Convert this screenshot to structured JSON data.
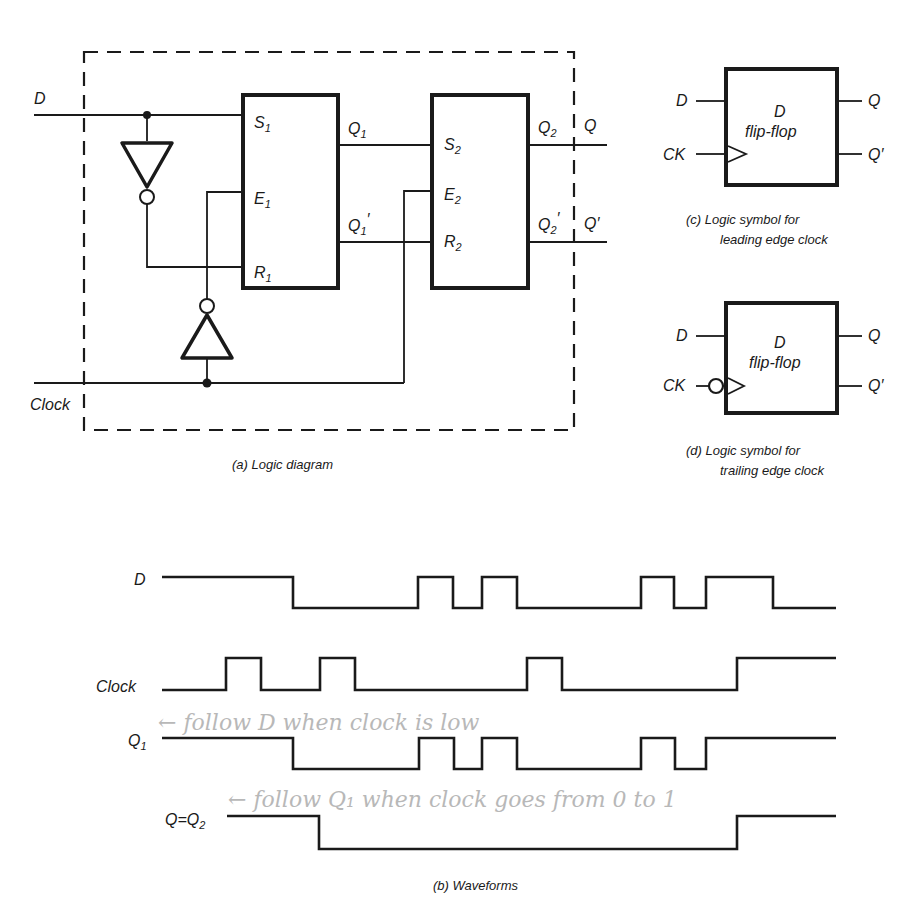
{
  "top_text_fragment": "...the output of the master, the edge at which the change is triggered by...",
  "logic_diagram": {
    "caption": "(a) Logic diagram",
    "inputs": {
      "d": "D",
      "clock": "Clock"
    },
    "master_latch": {
      "s": "S",
      "s_sub": "1",
      "e": "E",
      "e_sub": "1",
      "r": "R",
      "r_sub": "1"
    },
    "slave_latch": {
      "s": "S",
      "s_sub": "2",
      "e": "E",
      "e_sub": "2",
      "r": "R",
      "r_sub": "2"
    },
    "master_outputs": {
      "q": "Q",
      "q_sub": "1",
      "qn": "Q",
      "qn_sub": "1",
      "prime": "′"
    },
    "slave_outputs": {
      "q": "Q",
      "q_sub": "2",
      "qn": "Q",
      "qn_sub": "2",
      "prime": "′"
    },
    "external_outputs": {
      "q": "Q",
      "qn": "Q′"
    }
  },
  "symbol_leading": {
    "caption_line1": "(c)  Logic symbol for",
    "caption_line2": "leading edge clock",
    "title_line1": "D",
    "title_line2": "flip-flop",
    "pins": {
      "d": "D",
      "ck": "CK",
      "q": "Q",
      "qn": "Q′"
    }
  },
  "symbol_trailing": {
    "caption_line1": "(d)  Logic symbol for",
    "caption_line2": "trailing edge clock",
    "title_line1": "D",
    "title_line2": "flip-flop",
    "pins": {
      "d": "D",
      "ck": "CK",
      "q": "Q",
      "qn": "Q′"
    }
  },
  "waveforms": {
    "caption": "(b)  Waveforms",
    "signals": [
      {
        "name": "D",
        "sub": "",
        "initial": 1,
        "transitions_x": [
          293,
          418,
          453,
          482,
          517,
          641,
          674,
          706,
          773
        ],
        "x_start": 162,
        "x_end": 836
      },
      {
        "name": "Clock",
        "sub": "",
        "initial": 0,
        "transitions_x": [
          226,
          261,
          320,
          355,
          527,
          562,
          737
        ],
        "x_start": 162,
        "x_end": 836
      },
      {
        "name": "Q",
        "sub": "1",
        "initial": 1,
        "transitions_x": [
          293,
          419,
          454,
          482,
          517,
          641,
          675,
          706
        ],
        "x_start": 162,
        "x_end": 836
      },
      {
        "name": "Q=Q",
        "sub": "2",
        "initial": 1,
        "transitions_x": [
          319,
          737
        ],
        "x_start": 227,
        "x_end": 836
      }
    ],
    "handwritten_notes": [
      "← follow D when clock is low",
      "← follow Q₁ when clock goes from 0 to 1"
    ]
  }
}
